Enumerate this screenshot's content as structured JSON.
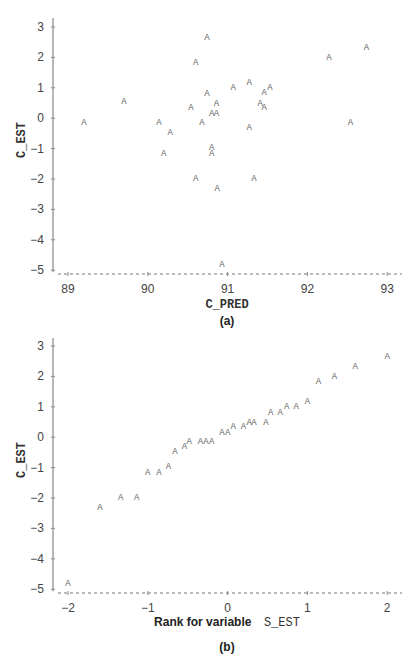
{
  "chart_data": [
    {
      "type": "scatter",
      "caption": "(a)",
      "title": "",
      "xlabel": "C_PRED",
      "ylabel": "C_EST",
      "xlim": [
        88.8,
        93.2
      ],
      "ylim": [
        -5.15,
        3.3
      ],
      "xticks": [
        89,
        90,
        91,
        92,
        93
      ],
      "yticks": [
        3,
        2,
        1,
        0,
        -1,
        -2,
        -3,
        -4,
        -5
      ],
      "marker": "A",
      "grid": false,
      "points": [
        {
          "x": 89.2,
          "y": -0.14
        },
        {
          "x": 89.7,
          "y": 0.55
        },
        {
          "x": 90.14,
          "y": -0.14
        },
        {
          "x": 90.28,
          "y": -0.44
        },
        {
          "x": 90.2,
          "y": -1.13
        },
        {
          "x": 90.74,
          "y": 2.67
        },
        {
          "x": 90.6,
          "y": 1.85
        },
        {
          "x": 90.74,
          "y": 0.83
        },
        {
          "x": 91.07,
          "y": 1.02
        },
        {
          "x": 91.27,
          "y": 1.2
        },
        {
          "x": 91.46,
          "y": 0.86
        },
        {
          "x": 91.53,
          "y": 1.02
        },
        {
          "x": 91.41,
          "y": 0.5
        },
        {
          "x": 91.46,
          "y": 0.36
        },
        {
          "x": 90.54,
          "y": 0.36
        },
        {
          "x": 90.86,
          "y": 0.5
        },
        {
          "x": 90.8,
          "y": 0.17
        },
        {
          "x": 90.86,
          "y": 0.17
        },
        {
          "x": 90.68,
          "y": -0.14
        },
        {
          "x": 91.27,
          "y": -0.3
        },
        {
          "x": 90.8,
          "y": -0.96
        },
        {
          "x": 90.8,
          "y": -1.13
        },
        {
          "x": 90.6,
          "y": -1.97
        },
        {
          "x": 91.33,
          "y": -1.97
        },
        {
          "x": 90.87,
          "y": -2.3
        },
        {
          "x": 90.93,
          "y": -4.8
        },
        {
          "x": 92.27,
          "y": 2.0
        },
        {
          "x": 92.74,
          "y": 2.35
        },
        {
          "x": 92.54,
          "y": -0.14
        }
      ]
    },
    {
      "type": "scatter",
      "caption": "(b)",
      "title": "",
      "xlabel_prefix": "Rank for variable",
      "xlabel_var": "S_EST",
      "ylabel": "C_EST",
      "xlim": [
        -2.2,
        2.2
      ],
      "ylim": [
        -5.15,
        3.3
      ],
      "xticks": [
        -2,
        -1,
        0,
        1,
        2
      ],
      "yticks": [
        3,
        2,
        1,
        0,
        -1,
        -2,
        -3,
        -4,
        -5
      ],
      "marker": "A",
      "grid": false,
      "points": [
        {
          "x": -2.0,
          "y": -4.8
        },
        {
          "x": -1.6,
          "y": -2.3
        },
        {
          "x": -1.34,
          "y": -1.97
        },
        {
          "x": -1.14,
          "y": -1.97
        },
        {
          "x": -1.0,
          "y": -1.13
        },
        {
          "x": -0.86,
          "y": -1.13
        },
        {
          "x": -0.74,
          "y": -0.96
        },
        {
          "x": -0.66,
          "y": -0.44
        },
        {
          "x": -0.54,
          "y": -0.3
        },
        {
          "x": -0.48,
          "y": -0.14
        },
        {
          "x": -0.34,
          "y": -0.14
        },
        {
          "x": -0.27,
          "y": -0.14
        },
        {
          "x": -0.2,
          "y": -0.14
        },
        {
          "x": -0.07,
          "y": 0.17
        },
        {
          "x": 0.0,
          "y": 0.17
        },
        {
          "x": 0.07,
          "y": 0.36
        },
        {
          "x": 0.2,
          "y": 0.36
        },
        {
          "x": 0.27,
          "y": 0.5
        },
        {
          "x": 0.33,
          "y": 0.5
        },
        {
          "x": 0.48,
          "y": 0.5
        },
        {
          "x": 0.54,
          "y": 0.83
        },
        {
          "x": 0.66,
          "y": 0.83
        },
        {
          "x": 0.74,
          "y": 1.02
        },
        {
          "x": 0.86,
          "y": 1.02
        },
        {
          "x": 1.0,
          "y": 1.2
        },
        {
          "x": 1.14,
          "y": 1.85
        },
        {
          "x": 1.34,
          "y": 2.0
        },
        {
          "x": 1.6,
          "y": 2.35
        },
        {
          "x": 2.0,
          "y": 2.67
        }
      ]
    }
  ],
  "colors": {
    "axis": "#888888",
    "baseline": "#777777",
    "marker": "#666666",
    "text": "#333333"
  }
}
